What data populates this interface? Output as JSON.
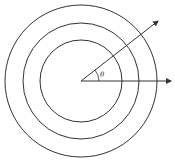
{
  "diagram": {
    "type": "concentric-circles-with-rays",
    "center": [
      81,
      81
    ],
    "circles": [
      {
        "r": 41
      },
      {
        "r": 58
      },
      {
        "r": 76
      }
    ],
    "rays": [
      {
        "name": "angled-ray",
        "to": [
          159,
          20
        ]
      },
      {
        "name": "horizontal-ray",
        "to": [
          172,
          82
        ]
      }
    ],
    "angle_label": "θ",
    "stroke_color": "#333333"
  }
}
